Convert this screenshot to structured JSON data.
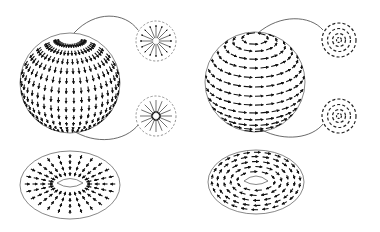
{
  "figure": {
    "panels": [
      {
        "id": "sphere-radial",
        "shape": "sphere",
        "field": "meridional arrows flowing from north pole to south pole",
        "center": [
          70,
          83
        ],
        "radius": 50,
        "insets": [
          {
            "id": "north-pole-source",
            "pattern": "radial-outward",
            "center": [
              156,
              41
            ],
            "radius": 20
          },
          {
            "id": "south-pole-sink",
            "pattern": "radial-inward",
            "center": [
              156,
              116
            ],
            "radius": 20
          }
        ]
      },
      {
        "id": "sphere-rotational",
        "shape": "sphere",
        "field": "latitudinal arrows circulating around the pole axis",
        "center": [
          255,
          82
        ],
        "radius": 50,
        "insets": [
          {
            "id": "north-pole-vortex",
            "pattern": "concentric-circulation",
            "center": [
              339,
              40
            ],
            "radius": 18
          },
          {
            "id": "south-pole-vortex",
            "pattern": "concentric-circulation",
            "center": [
              339,
              116
            ],
            "radius": 18
          }
        ]
      },
      {
        "id": "torus-meridional",
        "shape": "torus",
        "field": "arrows along meridians converging to the inner hole",
        "center": [
          70,
          185
        ],
        "rx": 50,
        "ry": 34
      },
      {
        "id": "torus-longitudinal",
        "shape": "torus",
        "field": "arrows along concentric longitudes circulating around the hole",
        "center": [
          256,
          182
        ],
        "rx": 48,
        "ry": 32
      }
    ],
    "colors": {
      "background": "#ffffff",
      "ink": "#111111",
      "outline": "#555555",
      "inset_border": "#777777"
    }
  }
}
